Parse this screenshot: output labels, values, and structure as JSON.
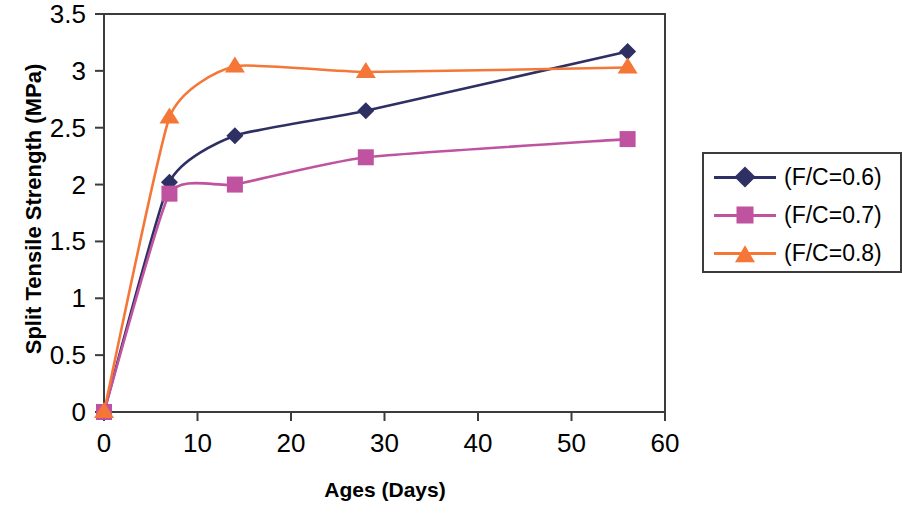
{
  "chart_data": {
    "type": "line",
    "title": "",
    "xlabel": "Ages (Days)",
    "ylabel": "Split Tensile Strength (MPa)",
    "xlim": [
      0,
      60
    ],
    "ylim": [
      0,
      3.5
    ],
    "xticks": [
      0,
      10,
      20,
      30,
      40,
      50,
      60
    ],
    "yticks": [
      0,
      0.5,
      1,
      1.5,
      2,
      2.5,
      3,
      3.5
    ],
    "xtick_labels": [
      "0",
      "10",
      "20",
      "30",
      "40",
      "50",
      "60"
    ],
    "ytick_labels": [
      "0",
      "0.5",
      "1",
      "1.5",
      "2",
      "2.5",
      "3",
      "3.5"
    ],
    "grid": false,
    "legend_position": "right-outside",
    "x": [
      0,
      7,
      14,
      28,
      56
    ],
    "series": [
      {
        "name": "(F/C=0.6)",
        "marker": "diamond",
        "color": "#2e2f62",
        "values": [
          0,
          2.02,
          2.43,
          2.65,
          3.17
        ]
      },
      {
        "name": "(F/C=0.7)",
        "marker": "square",
        "color": "#c0539f",
        "values": [
          0,
          1.92,
          2.0,
          2.24,
          2.4
        ]
      },
      {
        "name": "(F/C=0.8)",
        "marker": "triangle",
        "color": "#f47738",
        "values": [
          0,
          2.59,
          3.04,
          2.99,
          3.03
        ]
      }
    ]
  },
  "axis": {
    "x_title": "Ages (Days)",
    "y_title": "Split Tensile Strength (MPa)",
    "x_tick_labels": [
      "0",
      "10",
      "20",
      "30",
      "40",
      "50",
      "60"
    ],
    "y_tick_labels": [
      "0",
      "0.5",
      "1",
      "1.5",
      "2",
      "2.5",
      "3",
      "3.5"
    ]
  },
  "legend": {
    "entries": [
      {
        "label": "(F/C=0.6)",
        "color": "#2e2f62",
        "marker": "diamond-marker-icon"
      },
      {
        "label": "(F/C=0.7)",
        "color": "#c0539f",
        "marker": "square-marker-icon"
      },
      {
        "label": "(F/C=0.8)",
        "color": "#f47738",
        "marker": "triangle-marker-icon"
      }
    ]
  },
  "colors": {
    "axis": "#3c3c3c",
    "background": "#ffffff",
    "series_1": "#2e2f62",
    "series_2": "#c0539f",
    "series_3": "#f47738"
  }
}
